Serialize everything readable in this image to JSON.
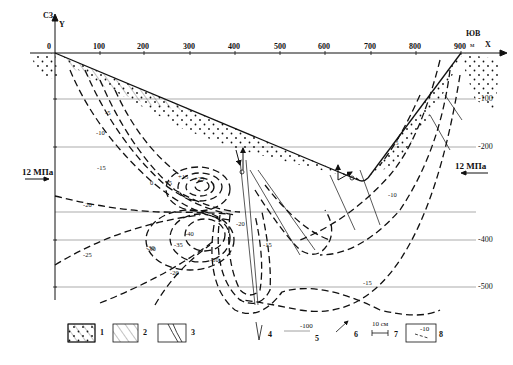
{
  "axes": {
    "north_west_label": "СЗ",
    "south_east_label": "ЮВ",
    "y_axis_label": "Y",
    "x_axis_label": "X",
    "unit": "м",
    "x_ticks": [
      "0",
      "100",
      "200",
      "300",
      "400",
      "500",
      "600",
      "700",
      "800",
      "900"
    ],
    "depth_ticks": [
      "-100",
      "-200",
      "-400",
      "-500"
    ]
  },
  "stress": {
    "left_label": "12 МПа",
    "right_label": "12 МПа",
    "left_direction": "right",
    "right_direction": "left"
  },
  "isolines": {
    "left_slope": [
      "-5",
      "-10",
      "-15"
    ],
    "right_slope": [
      "-5",
      "-10",
      "-15"
    ],
    "center": [
      "0",
      "+5",
      "+15",
      "+25",
      "-20",
      "-25",
      "-30",
      "-35",
      "-40",
      "-30",
      "-20",
      "-10",
      "-20",
      "-15"
    ]
  },
  "legend": {
    "items": [
      {
        "num": "1",
        "desc": "dotted-hatched-fill"
      },
      {
        "num": "2",
        "desc": "hatched-fill"
      },
      {
        "num": "3",
        "desc": "layered-band"
      },
      {
        "num": "4",
        "desc": "fault-tick"
      },
      {
        "num": "5",
        "desc": "depth-line",
        "sample": "-100"
      },
      {
        "num": "6",
        "desc": "displacement-arrow"
      },
      {
        "num": "7",
        "desc": "scale-bar",
        "sample": "10 см"
      },
      {
        "num": "8",
        "desc": "isoline-box",
        "sample": "-10"
      }
    ]
  },
  "colors": {
    "ink": "#111111",
    "grid": "#888888",
    "background": "#ffffff"
  }
}
